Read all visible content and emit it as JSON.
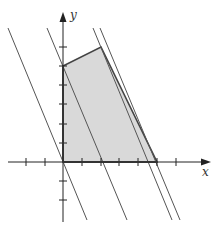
{
  "figure": {
    "type": "linear-programming-feasible-region",
    "axes": {
      "x_label": "x",
      "y_label": "y",
      "x_ticks": [
        -3,
        -2,
        -1,
        1,
        2,
        3,
        4,
        5,
        6,
        7
      ],
      "y_ticks": [
        -3,
        -2,
        -1,
        1,
        2,
        3,
        4,
        5,
        6
      ],
      "x_range": [
        -3,
        7.7
      ],
      "y_range": [
        -3.1,
        7.8
      ]
    },
    "feasible_region": {
      "vertices": [
        [
          0,
          0
        ],
        [
          0,
          5
        ],
        [
          2,
          6
        ],
        [
          5,
          0
        ]
      ],
      "fill_color": "#d9d9d9",
      "edge_color": "#444444"
    },
    "level_lines": [
      {
        "name": "level-line-1",
        "through": [
          0,
          0
        ],
        "slope": -2.4
      },
      {
        "name": "level-line-2",
        "through": [
          2,
          0
        ],
        "slope": -2.4
      },
      {
        "name": "level-line-3",
        "through": [
          2,
          6
        ],
        "slope": -2.4
      },
      {
        "name": "level-line-4",
        "through": [
          2.4,
          6
        ],
        "slope": -2.4
      }
    ],
    "colors": {
      "axis": "#222222",
      "level_line": "#555555"
    }
  }
}
